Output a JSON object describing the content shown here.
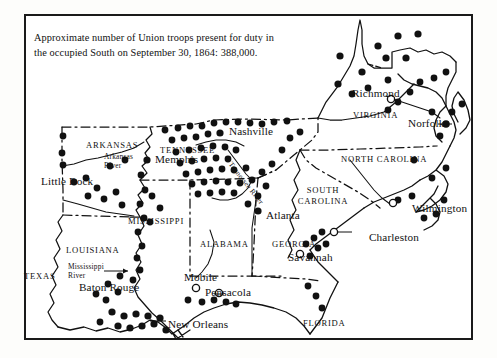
{
  "figure": {
    "title_caption_line1": "Approximate number of Union troops present for duty in",
    "title_caption_line2": "the occupied South on September 30, 1864: 388,000.",
    "troop_count": "388,000",
    "date": "September 30, 1864",
    "frame_color": "#1a1a1a",
    "background_color": "#ffffff",
    "ink_color": "#111111"
  },
  "legend_semantics": {
    "filled_dot": "Union-occupied post / garrison",
    "hollow_circle": "City not occupied by Union troops"
  },
  "states": [
    {
      "name": "TEXAS",
      "x": 24,
      "y": 271
    },
    {
      "name": "ARKANSAS",
      "x": 86,
      "y": 140
    },
    {
      "name": "LOUISIANA",
      "x": 66,
      "y": 245
    },
    {
      "name": "MISSISSIPPI",
      "x": 128,
      "y": 216
    },
    {
      "name": "ALABAMA",
      "x": 200,
      "y": 239
    },
    {
      "name": "TENNESSEE",
      "x": 160,
      "y": 145
    },
    {
      "name": "GEORGIA",
      "x": 272,
      "y": 239
    },
    {
      "name": "FLORIDA",
      "x": 303,
      "y": 318
    },
    {
      "name": "SOUTH\nCAROLINA",
      "x": 306,
      "y": 190
    },
    {
      "name": "NORTH CAROLINA",
      "x": 341,
      "y": 154
    },
    {
      "name": "VIRGINIA",
      "x": 353,
      "y": 110
    }
  ],
  "cities": [
    {
      "name": "Little Rock",
      "x": 41,
      "y": 180,
      "marker": "filled",
      "two_line": true
    },
    {
      "name": "Memphis",
      "x": 155,
      "y": 160,
      "marker": "filled"
    },
    {
      "name": "Nashville",
      "x": 229,
      "y": 131,
      "marker": "filled"
    },
    {
      "name": "Richmond",
      "x": 355,
      "y": 94,
      "marker": "hollow"
    },
    {
      "name": "Norfolk",
      "x": 412,
      "y": 124,
      "marker": "filled"
    },
    {
      "name": "Wilmington",
      "x": 413,
      "y": 209,
      "marker": "hollow"
    },
    {
      "name": "Charleston",
      "x": 371,
      "y": 237,
      "marker": "hollow"
    },
    {
      "name": "Savannah",
      "x": 294,
      "y": 258,
      "marker": "hollow"
    },
    {
      "name": "Atlanta",
      "x": 271,
      "y": 216,
      "marker": "filled"
    },
    {
      "name": "Mobile",
      "x": 186,
      "y": 277,
      "marker": "hollow"
    },
    {
      "name": "Pensacola",
      "x": 208,
      "y": 291,
      "marker": "hollow"
    },
    {
      "name": "Baton Rouge",
      "x": 79,
      "y": 287,
      "marker": "filled",
      "two_line": true
    },
    {
      "name": "New Orleans",
      "x": 170,
      "y": 325,
      "marker": "filled"
    }
  ],
  "rivers": [
    {
      "name": "Arkansas\nRiver",
      "x": 107,
      "y": 154
    },
    {
      "name": "Mississippi\nRiver",
      "x": 76,
      "y": 266
    },
    {
      "name": "Tennessee River",
      "x": 238,
      "y": 168
    }
  ],
  "chart_data": {
    "type": "map",
    "total_troops": 388000,
    "marker_legend": {
      "filled": "Union garrison / occupied post",
      "hollow": "Unoccupied Confederate city"
    },
    "garrison_dots_filled": 152,
    "unoccupied_circles": 6,
    "regions_covered": [
      "Virginia",
      "North Carolina",
      "South Carolina",
      "Georgia",
      "Florida",
      "Alabama",
      "Mississippi",
      "Tennessee",
      "Arkansas",
      "Louisiana",
      "Texas"
    ]
  }
}
